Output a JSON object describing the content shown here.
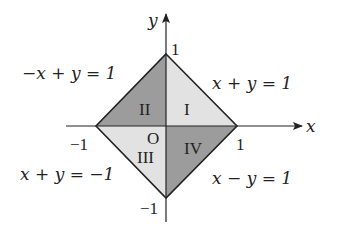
{
  "diagram": {
    "axes": {
      "x_label": "x",
      "y_label": "y"
    },
    "ticks": {
      "x_pos": "1",
      "x_neg": "−1",
      "y_pos": "1",
      "y_neg": "−1",
      "origin": "O"
    },
    "regions": [
      {
        "id": "I",
        "label": "I",
        "shade": "#e0e0e0"
      },
      {
        "id": "II",
        "label": "II",
        "shade": "#9a9a9a"
      },
      {
        "id": "III",
        "label": "III",
        "shade": "#e0e0e0"
      },
      {
        "id": "IV",
        "label": "IV",
        "shade": "#9a9a9a"
      }
    ],
    "equations": {
      "top_left": "−x + y = 1",
      "top_right": "x + y = 1",
      "bottom_left": "x + y = −1",
      "bottom_right": "x − y = 1"
    }
  }
}
